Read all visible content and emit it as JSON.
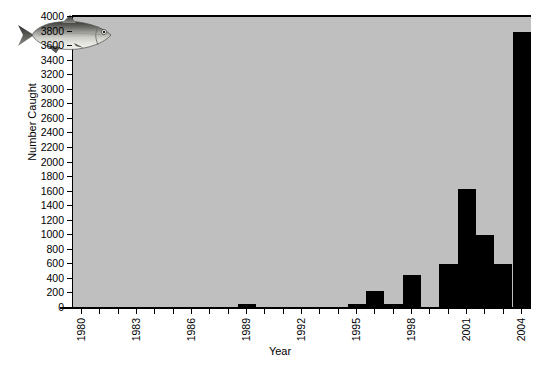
{
  "chart_data": {
    "type": "bar",
    "title": "",
    "xlabel": "Year",
    "ylabel": "Number Caught",
    "xlim": [
      1979.5,
      2004.5
    ],
    "ylim": [
      0,
      4000
    ],
    "ytick_step": 200,
    "xtick_step": 1,
    "xtick_label_step": 3,
    "grid": false,
    "legend": null,
    "plot_background": "#bfbfbf",
    "bar_color": "#000000",
    "axis_color": "#000000",
    "categories": [
      "1980",
      "1981",
      "1982",
      "1983",
      "1984",
      "1985",
      "1986",
      "1987",
      "1988",
      "1989",
      "1990",
      "1991",
      "1992",
      "1993",
      "1994",
      "1995",
      "1996",
      "1997",
      "1998",
      "1999",
      "2000",
      "2001",
      "2002",
      "2003",
      "2004"
    ],
    "values": [
      0,
      0,
      0,
      0,
      20,
      0,
      0,
      20,
      0,
      60,
      0,
      20,
      0,
      20,
      0,
      60,
      240,
      60,
      460,
      20,
      600,
      1640,
      1000,
      600,
      3800
    ],
    "ytick_labels": [
      "0",
      "200",
      "400",
      "600",
      "800",
      "1000",
      "1200",
      "1400",
      "1600",
      "1800",
      "2000",
      "2200",
      "2400",
      "2600",
      "2800",
      "3000",
      "3200",
      "3400",
      "3600",
      "3800",
      "4000"
    ],
    "xtick_labels": [
      "1980",
      "1983",
      "1986",
      "1989",
      "1992",
      "1995",
      "1998",
      "2001",
      "2004"
    ]
  },
  "figure": {
    "fish_illustration_name": "fish-illustration"
  }
}
